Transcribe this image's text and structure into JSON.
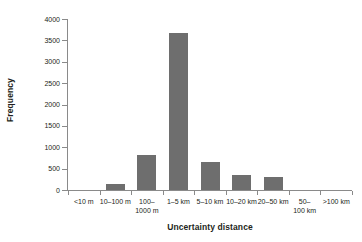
{
  "chart_data": {
    "type": "bar",
    "title": "",
    "xlabel": "Uncertainty distance",
    "ylabel": "Frequency",
    "categories": [
      "<10 m",
      "10–100 m",
      "100–\n1000 m",
      "1–5 km",
      "5–10 km",
      "10–20 km",
      "20–50 km",
      "50–\n100 km",
      ">100 km"
    ],
    "values": [
      0,
      140,
      815,
      3670,
      650,
      350,
      300,
      0,
      0
    ],
    "ylim": [
      0,
      4000
    ],
    "yticks": [
      0,
      500,
      1000,
      1500,
      2000,
      2500,
      3000,
      3500,
      4000
    ],
    "ytick_labels": [
      "0",
      "500",
      "1000",
      "1500",
      "2000",
      "2500",
      "3000",
      "3500",
      "4000"
    ],
    "grid": false,
    "legend": "none",
    "bar_color": "#6e6e6e",
    "axis_color": "#8a8a8a",
    "text_color": "#231f20"
  }
}
